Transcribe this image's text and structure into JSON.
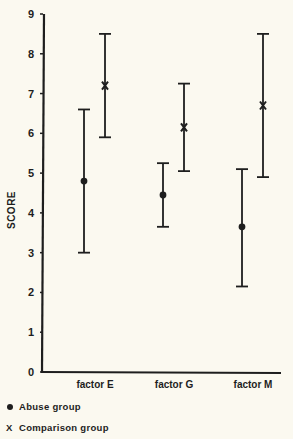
{
  "chart_data": {
    "type": "errorbar",
    "title": "",
    "xlabel": "",
    "ylabel": "SCORE",
    "ylim": [
      0,
      9
    ],
    "yticks": [
      0,
      1,
      2,
      3,
      4,
      5,
      6,
      7,
      8,
      9
    ],
    "grid": false,
    "legend_position": "bottom-left",
    "categories": [
      "factor E",
      "factor G",
      "factor M"
    ],
    "series": [
      {
        "name": "Abuse group",
        "marker": "dot",
        "values": [
          4.8,
          4.45,
          3.65
        ],
        "upper": [
          6.6,
          5.25,
          5.1
        ],
        "lower": [
          3.0,
          3.65,
          2.15
        ]
      },
      {
        "name": "Comparison group",
        "marker": "x",
        "values": [
          7.2,
          6.15,
          6.7
        ],
        "upper": [
          8.5,
          7.25,
          8.5
        ],
        "lower": [
          5.9,
          5.05,
          4.9
        ]
      }
    ]
  },
  "legend": {
    "items": [
      {
        "symbol": "●",
        "label": "Abuse group"
      },
      {
        "symbol": "X",
        "label": "Comparison group"
      }
    ]
  },
  "colors": {
    "background": "#fbf9f0",
    "ink": "#1e1e1e"
  }
}
